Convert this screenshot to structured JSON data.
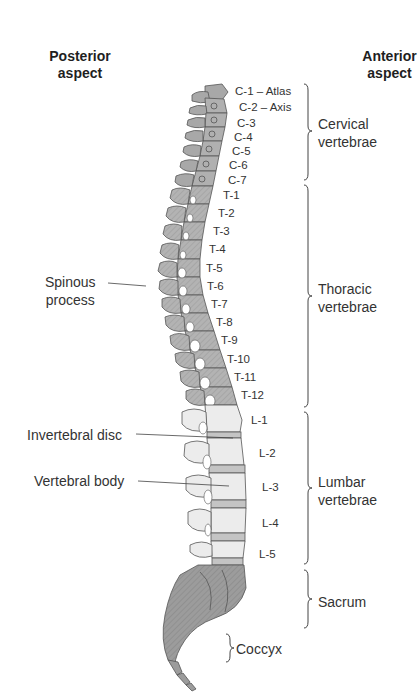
{
  "headers": {
    "posterior": [
      "Posterior",
      "aspect"
    ],
    "anterior": [
      "Anterior",
      "aspect"
    ]
  },
  "vertebrae_labels": [
    {
      "id": "C-1",
      "text": "C-1 – Atlas",
      "x": 235,
      "y": 85
    },
    {
      "id": "C-2",
      "text": "C-2 – Axis",
      "x": 239,
      "y": 101
    },
    {
      "id": "C-3",
      "text": "C-3",
      "x": 237,
      "y": 117
    },
    {
      "id": "C-4",
      "text": "C-4",
      "x": 234,
      "y": 131
    },
    {
      "id": "C-5",
      "text": "C-5",
      "x": 232,
      "y": 145
    },
    {
      "id": "C-6",
      "text": "C-6",
      "x": 229,
      "y": 159
    },
    {
      "id": "C-7",
      "text": "C-7",
      "x": 228,
      "y": 174
    },
    {
      "id": "T-1",
      "text": "T-1",
      "x": 223,
      "y": 189
    },
    {
      "id": "T-2",
      "text": "T-2",
      "x": 218,
      "y": 207
    },
    {
      "id": "T-3",
      "text": "T-3",
      "x": 213,
      "y": 225
    },
    {
      "id": "T-4",
      "text": "T-4",
      "x": 209,
      "y": 243
    },
    {
      "id": "T-5",
      "text": "T-5",
      "x": 206,
      "y": 262
    },
    {
      "id": "T-6",
      "text": "T-6",
      "x": 207,
      "y": 280
    },
    {
      "id": "T-7",
      "text": "T-7",
      "x": 211,
      "y": 298
    },
    {
      "id": "T-8",
      "text": "T-8",
      "x": 216,
      "y": 316
    },
    {
      "id": "T-9",
      "text": "T-9",
      "x": 221,
      "y": 334
    },
    {
      "id": "T-10",
      "text": "T-10",
      "x": 227,
      "y": 353
    },
    {
      "id": "T-11",
      "text": "T-11",
      "x": 234,
      "y": 371
    },
    {
      "id": "T-12",
      "text": "T-12",
      "x": 241,
      "y": 389
    },
    {
      "id": "L-1",
      "text": "L-1",
      "x": 251,
      "y": 414
    },
    {
      "id": "L-2",
      "text": "L-2",
      "x": 259,
      "y": 447
    },
    {
      "id": "L-3",
      "text": "L-3",
      "x": 262,
      "y": 481
    },
    {
      "id": "L-4",
      "text": "L-4",
      "x": 262,
      "y": 517
    },
    {
      "id": "L-5",
      "text": "L-5",
      "x": 259,
      "y": 548
    }
  ],
  "regions": [
    {
      "id": "cervical",
      "lines": [
        "Cervical",
        "vertebrae"
      ],
      "bracket_top": 84,
      "bracket_bottom": 180
    },
    {
      "id": "thoracic",
      "lines": [
        "Thoracic",
        "vertebrae"
      ],
      "bracket_top": 185,
      "bracket_bottom": 407
    },
    {
      "id": "lumbar",
      "lines": [
        "Lumbar",
        "vertebrae"
      ],
      "bracket_top": 412,
      "bracket_bottom": 564
    },
    {
      "id": "sacrum",
      "lines": [
        "Sacrum"
      ],
      "bracket_top": 570,
      "bracket_bottom": 628
    },
    {
      "id": "coccyx",
      "lines": [
        "Coccyx"
      ],
      "bracket_top": 634,
      "bracket_bottom": 662
    }
  ],
  "callouts": [
    {
      "id": "spinous-process",
      "lines": [
        "Spinous",
        "process"
      ]
    },
    {
      "id": "intervertebral-disc",
      "lines": [
        "Invertebral disc"
      ]
    },
    {
      "id": "vertebral-body",
      "lines": [
        "Vertebral body"
      ]
    }
  ],
  "colors": {
    "bone_dark": "#9a9a9a",
    "bone_mid": "#b5b5b5",
    "bone_light": "#ececec",
    "outline": "#555555",
    "text": "#333333"
  }
}
